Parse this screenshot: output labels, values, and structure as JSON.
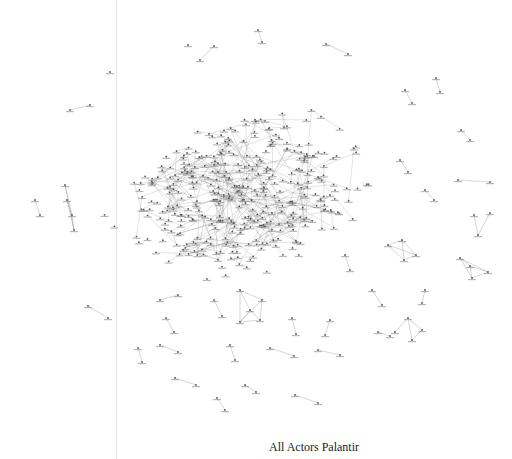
{
  "caption": "All Actors Palantir",
  "colors": {
    "edge": "#9a9a9a",
    "node": "#555555",
    "label": "#888888",
    "divider": "#e6e6e6"
  },
  "network": {
    "description": "force-directed network graph of actors",
    "core_cluster": {
      "cx": 240,
      "cy": 195,
      "rx": 95,
      "ry": 60,
      "node_count": 380
    },
    "peripheral_components": [
      {
        "nodes": [
          [
            188,
            45
          ],
          [
            200,
            60
          ],
          [
            214,
            46
          ]
        ]
      },
      {
        "nodes": [
          [
            258,
            30
          ],
          [
            262,
            42
          ]
        ]
      },
      {
        "nodes": [
          [
            326,
            44
          ],
          [
            348,
            54
          ]
        ]
      },
      {
        "nodes": [
          [
            110,
            72
          ]
        ]
      },
      {
        "nodes": [
          [
            70,
            110
          ],
          [
            90,
            105
          ]
        ]
      },
      {
        "nodes": [
          [
            405,
            90
          ],
          [
            412,
            103
          ]
        ]
      },
      {
        "nodes": [
          [
            436,
            78
          ],
          [
            440,
            92
          ]
        ]
      },
      {
        "nodes": [
          [
            461,
            130
          ],
          [
            470,
            140
          ]
        ]
      },
      {
        "nodes": [
          [
            400,
            160
          ],
          [
            408,
            172
          ]
        ]
      },
      {
        "nodes": [
          [
            458,
            180
          ],
          [
            490,
            182
          ]
        ]
      },
      {
        "nodes": [
          [
            425,
            190
          ],
          [
            434,
            200
          ]
        ]
      },
      {
        "nodes": [
          [
            65,
            185
          ],
          [
            67,
            200
          ],
          [
            72,
            215
          ],
          [
            74,
            230
          ]
        ]
      },
      {
        "nodes": [
          [
            35,
            200
          ],
          [
            40,
            215
          ]
        ]
      },
      {
        "nodes": [
          [
            474,
            215
          ],
          [
            490,
            213
          ],
          [
            478,
            235
          ]
        ]
      },
      {
        "nodes": [
          [
            388,
            245
          ],
          [
            402,
            240
          ],
          [
            416,
            255
          ],
          [
            404,
            260
          ]
        ]
      },
      {
        "nodes": [
          [
            460,
            258
          ],
          [
            470,
            266
          ],
          [
            488,
            272
          ],
          [
            472,
            278
          ]
        ]
      },
      {
        "nodes": [
          [
            345,
            255
          ],
          [
            350,
            270
          ]
        ]
      },
      {
        "nodes": [
          [
            425,
            290
          ],
          [
            422,
            303
          ]
        ]
      },
      {
        "nodes": [
          [
            372,
            290
          ],
          [
            382,
            305
          ]
        ]
      },
      {
        "nodes": [
          [
            88,
            306
          ],
          [
            108,
            318
          ]
        ]
      },
      {
        "nodes": [
          [
            240,
            290
          ],
          [
            262,
            300
          ],
          [
            260,
            320
          ],
          [
            240,
            322
          ],
          [
            250,
            310
          ]
        ]
      },
      {
        "nodes": [
          [
            160,
            300
          ],
          [
            178,
            295
          ]
        ]
      },
      {
        "nodes": [
          [
            214,
            300
          ],
          [
            222,
            316
          ]
        ]
      },
      {
        "nodes": [
          [
            408,
            318
          ],
          [
            395,
            332
          ],
          [
            412,
            340
          ],
          [
            422,
            330
          ]
        ]
      },
      {
        "nodes": [
          [
            378,
            332
          ],
          [
            390,
            336
          ]
        ]
      },
      {
        "nodes": [
          [
            330,
            320
          ],
          [
            325,
            335
          ]
        ]
      },
      {
        "nodes": [
          [
            292,
            318
          ],
          [
            296,
            334
          ]
        ]
      },
      {
        "nodes": [
          [
            138,
            348
          ],
          [
            142,
            362
          ]
        ]
      },
      {
        "nodes": [
          [
            160,
            345
          ],
          [
            178,
            352
          ]
        ]
      },
      {
        "nodes": [
          [
            230,
            345
          ],
          [
            235,
            360
          ]
        ]
      },
      {
        "nodes": [
          [
            270,
            348
          ],
          [
            294,
            356
          ]
        ]
      },
      {
        "nodes": [
          [
            318,
            350
          ],
          [
            340,
            355
          ]
        ]
      },
      {
        "nodes": [
          [
            175,
            378
          ],
          [
            196,
            385
          ]
        ]
      },
      {
        "nodes": [
          [
            245,
            385
          ],
          [
            256,
            392
          ]
        ]
      },
      {
        "nodes": [
          [
            295,
            395
          ],
          [
            318,
            403
          ]
        ]
      },
      {
        "nodes": [
          [
            217,
            398
          ],
          [
            225,
            410
          ]
        ]
      },
      {
        "nodes": [
          [
            166,
            318
          ],
          [
            174,
            332
          ]
        ]
      }
    ]
  }
}
